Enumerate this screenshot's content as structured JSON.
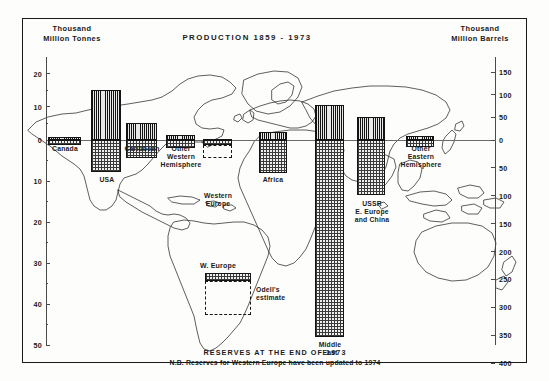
{
  "title": "PRODUCTION  1859 - 1973",
  "left_axis_header": "Thousand\nMillion Tonnes",
  "right_axis_header": "Thousand\nMillion  Barrels",
  "caption_line1": "RESERVES AT THE END OF 1973",
  "caption_line2": "N.B. Reserves for Western Europe have been updated to 1974",
  "legend": {
    "title": "W. Europe",
    "estimate_label": "Odell's\nestimate"
  },
  "left_ticks": [
    "20",
    "10",
    "0",
    "10",
    "20",
    "30",
    "40",
    "50"
  ],
  "right_ticks": [
    "150",
    "100",
    "50",
    "0",
    "50",
    "100",
    "150",
    "200",
    "250",
    "300",
    "350",
    "400"
  ],
  "regions": [
    {
      "label": "Canada",
      "production": 1.0,
      "reserves": 1.3
    },
    {
      "label": "USA",
      "production": 15.0,
      "reserves": 7.8
    },
    {
      "label": "Caribbean",
      "production": 5.0,
      "reserves": 4.3
    },
    {
      "label": "Other\nWestern\nHemisphere",
      "production": 1.5,
      "reserves": 2.0
    },
    {
      "label": "Western\nEurope",
      "production": 0.4,
      "reserves": 4.5
    },
    {
      "label": "Africa",
      "production": 2.5,
      "reserves": 8.0
    },
    {
      "label": "Middle\nEast",
      "production": 10.5,
      "reserves": 48.0
    },
    {
      "label": "USSR\nE. Europe\nand China",
      "production": 7.0,
      "reserves": 13.5
    },
    {
      "label": "Other\nEastern\nHemisphere",
      "production": 1.2,
      "reserves": 1.6
    }
  ],
  "chart_data": {
    "type": "bar",
    "title": "PRODUCTION  1859 - 1973",
    "subtitle": "RESERVES AT THE END OF 1973",
    "note": "N.B. Reserves for Western Europe have been updated to 1974",
    "orientation": "vertical-diverging",
    "categories": [
      "Canada",
      "USA",
      "Caribbean",
      "Other Western Hemisphere",
      "Western Europe",
      "Africa",
      "Middle East",
      "USSR E. Europe and China",
      "Other Eastern Hemisphere"
    ],
    "series": [
      {
        "name": "Production 1859-1973 (above axis)",
        "unit": "Thousand Million Tonnes",
        "values": [
          1.0,
          15.0,
          5.0,
          1.5,
          0.4,
          2.5,
          10.5,
          7.0,
          1.2
        ]
      },
      {
        "name": "Reserves at end of 1973 (below axis)",
        "unit": "Thousand Million Tonnes",
        "values": [
          1.3,
          7.8,
          4.3,
          2.0,
          4.5,
          8.0,
          48.0,
          13.5,
          1.6
        ]
      }
    ],
    "annotations": [
      {
        "text": "Odell's estimate",
        "applies_to": "Western Europe",
        "type": "dashed-extension"
      }
    ],
    "ylabel_left": "Thousand Million Tonnes",
    "ylabel_right": "Thousand Million Barrels",
    "ylim_left": [
      20,
      -50
    ],
    "ylim_right": [
      150,
      -400
    ],
    "ytick_left": [
      20,
      10,
      0,
      -10,
      -20,
      -30,
      -40,
      -50
    ],
    "ytick_right": [
      150,
      100,
      50,
      0,
      -50,
      -100,
      -150,
      -200,
      -250,
      -300,
      -350,
      -400
    ],
    "grid": false,
    "legend_position": "inset-lower-center",
    "background_image": "world map outline"
  }
}
